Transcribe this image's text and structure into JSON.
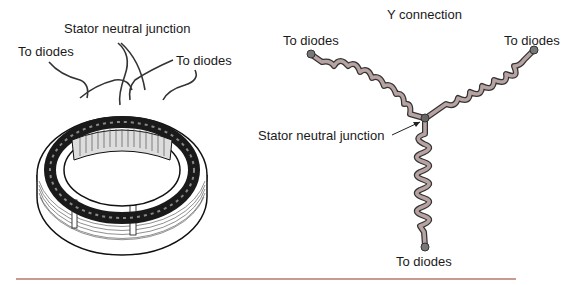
{
  "left_figure": {
    "title": "Stator neutral junction",
    "label_left": "To diodes",
    "label_right": "To diodes"
  },
  "right_figure": {
    "title": "Y connection",
    "label_top_left": "To diodes",
    "label_top_right": "To diodes",
    "label_bottom": "To diodes",
    "label_junction": "Stator neutral junction"
  },
  "colors": {
    "coil": "#b8a3a3",
    "coil_outline": "#333333",
    "terminal": "#777777",
    "rule": "#c99a94"
  }
}
